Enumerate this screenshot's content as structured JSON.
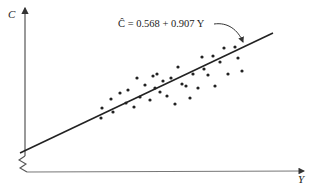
{
  "chart_data": {
    "type": "scatter",
    "title": "",
    "xlabel": "Y",
    "ylabel": "C",
    "grid": false,
    "legend": null,
    "axis_break": "y-axis (zigzag near origin)",
    "annotation": {
      "text": "Ĉ = 0.568 + 0.907 Y",
      "points_to": "regression line",
      "intercept": 0.568,
      "slope": 0.907
    },
    "regression_line": {
      "label": "Ĉ = 0.568 + 0.907 Y",
      "x1_px": 20,
      "y1_px": 153,
      "x2_px": 273,
      "y2_px": 33
    },
    "points_px": [
      [
        101,
        118
      ],
      [
        102,
        108
      ],
      [
        111,
        99
      ],
      [
        113,
        112
      ],
      [
        120,
        93
      ],
      [
        126,
        103
      ],
      [
        128,
        90
      ],
      [
        134,
        107
      ],
      [
        137,
        78
      ],
      [
        140,
        97
      ],
      [
        145,
        85
      ],
      [
        150,
        100
      ],
      [
        153,
        76
      ],
      [
        155,
        88
      ],
      [
        157,
        74
      ],
      [
        160,
        92
      ],
      [
        163,
        81
      ],
      [
        167,
        96
      ],
      [
        171,
        78
      ],
      [
        175,
        104
      ],
      [
        178,
        67
      ],
      [
        182,
        84
      ],
      [
        186,
        86
      ],
      [
        190,
        98
      ],
      [
        193,
        74
      ],
      [
        198,
        88
      ],
      [
        202,
        57
      ],
      [
        204,
        69
      ],
      [
        208,
        75
      ],
      [
        213,
        56
      ],
      [
        215,
        86
      ],
      [
        220,
        62
      ],
      [
        224,
        48
      ],
      [
        228,
        74
      ],
      [
        235,
        47
      ],
      [
        238,
        58
      ],
      [
        242,
        71
      ]
    ],
    "xlim": "unlabeled",
    "ylim": "unlabeled"
  },
  "labels": {
    "y_axis": "C",
    "x_axis": "Y",
    "equation": "Ĉ = 0.568 + 0.907 Y"
  },
  "colors": {
    "ink": "#222222",
    "axis": "#555555",
    "background": "#ffffff"
  }
}
